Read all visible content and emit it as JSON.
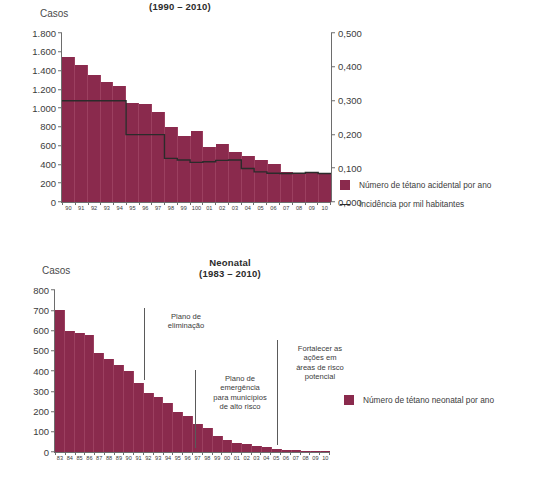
{
  "chart_data": [
    {
      "id": "acidental",
      "type": "bar",
      "title": "(1990 – 2010)",
      "ylabel": "Casos",
      "xlabel": "",
      "categories": [
        "90",
        "91",
        "92",
        "93",
        "94",
        "95",
        "96",
        "97",
        "98",
        "99",
        "100",
        "01",
        "02",
        "03",
        "04",
        "05",
        "06",
        "07",
        "08",
        "09",
        "10"
      ],
      "ylim": [
        0,
        1800
      ],
      "yticks": [
        "0",
        "200",
        "400",
        "600",
        "800",
        "1.000",
        "1.200",
        "1.400",
        "1.600",
        "1.800"
      ],
      "ytick_values": [
        0,
        200,
        400,
        600,
        800,
        1000,
        1200,
        1400,
        1600,
        1800
      ],
      "ylim_right": [
        0,
        0.5
      ],
      "yticks_right": [
        "0,000",
        "0,100",
        "0,200",
        "0,300",
        "0,400",
        "0,500"
      ],
      "ytick_values_right": [
        0,
        0.1,
        0.2,
        0.3,
        0.4,
        0.5
      ],
      "grid": false,
      "legend_position": "right",
      "series": [
        {
          "name": "Número de tétano acidental por ano",
          "kind": "bar",
          "axis": "left",
          "values": [
            1540,
            1460,
            1350,
            1280,
            1240,
            1050,
            1040,
            960,
            800,
            700,
            760,
            590,
            620,
            530,
            490,
            450,
            400,
            320,
            310,
            310,
            310
          ]
        },
        {
          "name": "Incidência por mil habitantes",
          "kind": "line",
          "axis": "right",
          "values": [
            0.3,
            0.3,
            0.3,
            0.3,
            0.3,
            0.2,
            0.2,
            0.2,
            0.13,
            0.125,
            0.118,
            0.12,
            0.124,
            0.125,
            0.1,
            0.09,
            0.086,
            0.085,
            0.086,
            0.088,
            0.085
          ]
        }
      ]
    },
    {
      "id": "neonatal",
      "type": "bar",
      "title": "Neonatal\n(1983 – 2010)",
      "ylabel": "Casos",
      "xlabel": "",
      "categories": [
        "83",
        "84",
        "85",
        "86",
        "87",
        "88",
        "89",
        "90",
        "91",
        "92",
        "93",
        "94",
        "95",
        "96",
        "97",
        "98",
        "99",
        "00",
        "01",
        "02",
        "03",
        "04",
        "05",
        "06",
        "07",
        "08",
        "09",
        "10"
      ],
      "ylim": [
        0,
        800
      ],
      "yticks": [
        "0",
        "100",
        "200",
        "300",
        "400",
        "500",
        "600",
        "700",
        "800"
      ],
      "ytick_values": [
        0,
        100,
        200,
        300,
        400,
        500,
        600,
        700,
        800
      ],
      "grid": false,
      "legend_position": "right",
      "series": [
        {
          "name": "Número de tétano neonatal por ano",
          "kind": "bar",
          "axis": "left",
          "values": [
            700,
            600,
            590,
            580,
            490,
            460,
            430,
            400,
            340,
            290,
            270,
            240,
            200,
            180,
            140,
            120,
            80,
            60,
            45,
            40,
            30,
            25,
            15,
            10,
            8,
            6,
            5,
            4
          ]
        }
      ],
      "annotations": [
        {
          "text": "Plano de\neliminação"
        },
        {
          "text": "Plano de\nemergência\npara municípios\nde alto risco"
        },
        {
          "text": "Fortalecer as\nações em\náreas de risco\npotencial"
        }
      ]
    }
  ],
  "top_chart": {
    "title": "(1990 – 2010)",
    "axis_label_casos": "Casos",
    "legend": [
      {
        "marker": "bar-swatch",
        "label": "Número de tétano acidental por ano"
      },
      {
        "marker": "line-swatch",
        "label": "Incidência por mil habitantes"
      }
    ]
  },
  "bottom_chart": {
    "title_line1": "Neonatal",
    "title_line2": "(1983 – 2010)",
    "axis_label_casos": "Casos",
    "legend": [
      {
        "marker": "bar-swatch",
        "label": "Número de tétano neonatal por ano"
      }
    ],
    "annotations": [
      "Plano de\neliminação",
      "Plano de\nemergência\npara municípios\nde alto risco",
      "Fortalecer as\nações em\náreas de risco\npotencial"
    ]
  },
  "colors": {
    "bar": "#8a2a4d",
    "line": "#2b2b2b",
    "axis": "#6d6d6d",
    "text": "#3b3b3b"
  }
}
